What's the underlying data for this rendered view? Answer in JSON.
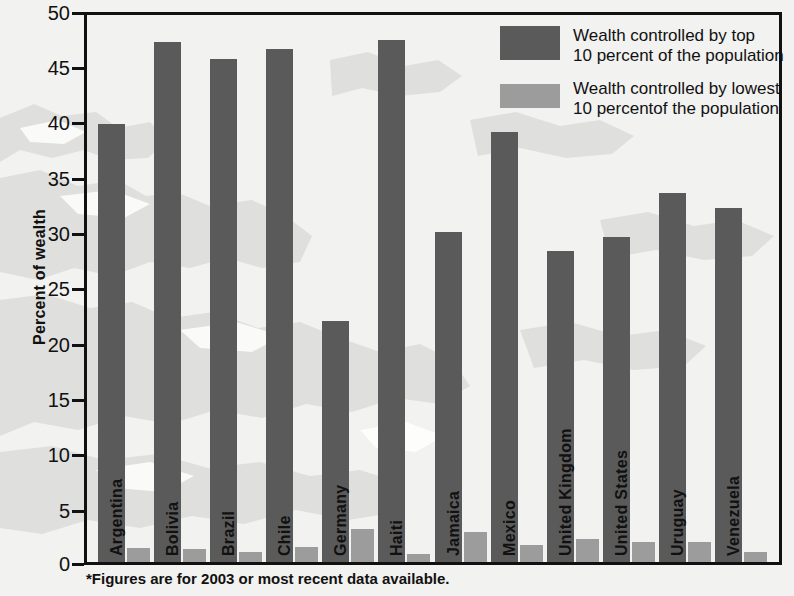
{
  "chart_data": {
    "type": "bar",
    "title": "",
    "xlabel": "",
    "ylabel": "Percent of wealth",
    "ylim": [
      0,
      50
    ],
    "yticks": [
      0,
      5,
      10,
      15,
      20,
      25,
      30,
      35,
      40,
      45,
      50
    ],
    "grid": false,
    "legend_position": "top-right",
    "categories": [
      "Argentina",
      "Bolivia",
      "Brazil",
      "Chile",
      "Germany",
      "Haiti",
      "Jamaica",
      "Mexico",
      "United Kingdom",
      "United States",
      "Uruguay",
      "Venezuela"
    ],
    "series": [
      {
        "name": "Wealth controlled by top 10 percent of the population",
        "color": "#5a5a5a",
        "values": [
          40.0,
          47.5,
          46.0,
          46.9,
          22.0,
          47.7,
          30.2,
          39.3,
          28.4,
          29.7,
          33.7,
          32.4
        ]
      },
      {
        "name": "Wealth controlled by lowest 10 percent of the population",
        "color": "#9c9c9c",
        "values": [
          1.3,
          1.2,
          0.9,
          1.4,
          3.0,
          0.7,
          2.7,
          1.6,
          2.1,
          1.8,
          1.8,
          0.9
        ]
      }
    ],
    "annotations": [
      "*Figures are for 2003 or most recent data available."
    ]
  },
  "axis": {
    "y_title": "Percent of wealth",
    "tick_labels": [
      "50",
      "45",
      "40",
      "35",
      "30",
      "25",
      "20",
      "15",
      "10",
      "5",
      "0"
    ]
  },
  "legend": {
    "entries": [
      {
        "swatch": "top",
        "line1": "Wealth controlled by top",
        "line2": "10 percent of the population"
      },
      {
        "swatch": "low",
        "line1": "Wealth controlled by lowest",
        "line2": "10 percentof the population"
      }
    ]
  },
  "footnote": {
    "text": "*Figures are for 2003 or most recent data available."
  },
  "colors": {
    "bar_top": "#5a5a5a",
    "bar_low": "#9c9c9c",
    "axis": "#111111",
    "background": "#f2f2f0",
    "map_silhouette": "#dedede"
  }
}
